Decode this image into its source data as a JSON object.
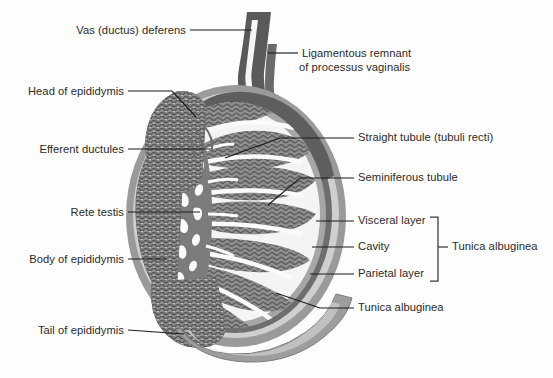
{
  "figure": {
    "background_color": "#fdfdfd",
    "width": 553,
    "height": 378
  },
  "palette": {
    "outer_parietal": "#9a9a9a",
    "cavity": "#cfcfcf",
    "visceral_layer": "#6e6e6e",
    "tunica_albuginea": "#a6a6a6",
    "interlobular_space": "#f4f4f4",
    "lobule_fill": "#8f8f8f",
    "tubule_stroke": "#5d5d5d",
    "mediastinum": "#7c7c7c",
    "rete_channel": "#fbfbfb",
    "epididymis": "#8a8a8a",
    "vas_deferens": "#5a5a5a",
    "label_text": "#2b2b2b",
    "leader_line": "#1d1d1d"
  },
  "labels": {
    "left": [
      {
        "id": "vas-deferens",
        "text": "Vas (ductus) deferens",
        "x": 186,
        "y": 34,
        "line": [
          [
            190,
            30
          ],
          [
            252,
            30
          ]
        ]
      },
      {
        "id": "head-of-epididymis",
        "text": "Head of epididymis",
        "x": 124,
        "y": 95,
        "line": [
          [
            128,
            91
          ],
          [
            172,
            91
          ],
          [
            196,
            117
          ]
        ]
      },
      {
        "id": "efferent-ductules",
        "text": "Efferent ductules",
        "x": 124,
        "y": 153,
        "line": [
          [
            128,
            149
          ],
          [
            211,
            149
          ]
        ]
      },
      {
        "id": "rete-testis",
        "text": "Rete testis",
        "x": 124,
        "y": 216,
        "line": [
          [
            128,
            212
          ],
          [
            200,
            212
          ]
        ]
      },
      {
        "id": "body-of-epididymis",
        "text": "Body of epididymis",
        "x": 124,
        "y": 263,
        "line": [
          [
            128,
            259
          ],
          [
            166,
            259
          ]
        ]
      },
      {
        "id": "tail-of-epididymis",
        "text": "Tail of epididymis",
        "x": 124,
        "y": 334,
        "line": [
          [
            128,
            330
          ],
          [
            184,
            334
          ]
        ]
      }
    ],
    "right": [
      {
        "id": "ligamentous-remnant",
        "text_line1": "Ligamentous remnant",
        "text_line2": "of processus vaginalis",
        "x": 302,
        "y": 57,
        "line": [
          [
            268,
            53
          ],
          [
            298,
            53
          ]
        ]
      },
      {
        "id": "straight-tubule",
        "text": "Straight tubule (tubuli recti)",
        "x": 358,
        "y": 141,
        "line": [
          [
            225,
            158
          ],
          [
            280,
            138
          ],
          [
            354,
            138
          ]
        ]
      },
      {
        "id": "seminiferous-tubule",
        "text": "Seminiferous tubule",
        "x": 358,
        "y": 181,
        "line": [
          [
            268,
            205
          ],
          [
            300,
            178
          ],
          [
            354,
            178
          ]
        ]
      },
      {
        "id": "visceral-layer",
        "text": "Visceral layer",
        "x": 358,
        "y": 224,
        "line": [
          [
            316,
            221
          ],
          [
            354,
            221
          ]
        ]
      },
      {
        "id": "cavity",
        "text": "Cavity",
        "x": 358,
        "y": 250,
        "line": [
          [
            312,
            247
          ],
          [
            354,
            247
          ]
        ]
      },
      {
        "id": "parietal-layer",
        "text": "Parietal layer",
        "x": 358,
        "y": 277,
        "line": [
          [
            310,
            274
          ],
          [
            354,
            274
          ]
        ]
      },
      {
        "id": "tunica-albuginea-pointer",
        "text": "Tunica albuginea",
        "x": 358,
        "y": 311,
        "line": [
          [
            276,
            293
          ],
          [
            320,
            308
          ],
          [
            354,
            308
          ]
        ]
      }
    ],
    "brace_group": {
      "id": "tunica-albuginea-brace",
      "text": "Tunica albuginea",
      "text_x": 452,
      "text_y": 250,
      "bracket": [
        [
          430,
          217
        ],
        [
          438,
          217
        ],
        [
          438,
          281
        ],
        [
          430,
          281
        ]
      ],
      "stem": [
        [
          438,
          247
        ],
        [
          448,
          247
        ]
      ]
    }
  },
  "anatomy": {
    "regions": [
      {
        "name": "tunica-vaginalis-parietal-layer",
        "note": "outermost mid-gray rim"
      },
      {
        "name": "tunica-vaginalis-cavity",
        "note": "light band between layers"
      },
      {
        "name": "tunica-vaginalis-visceral-layer",
        "note": "dark band on testis surface"
      },
      {
        "name": "tunica-albuginea",
        "note": "gray capsule inside visceral layer"
      },
      {
        "name": "seminiferous-lobules",
        "note": "wedge segments radiating from mediastinum"
      },
      {
        "name": "mediastinum-testis",
        "note": "central gray mass with rete channels"
      },
      {
        "name": "epididymis-head",
        "note": "convoluted mass upper-left"
      },
      {
        "name": "epididymis-body",
        "note": "convoluted band along left margin"
      },
      {
        "name": "epididymis-tail",
        "note": "convoluted mass lower-left"
      },
      {
        "name": "vas-deferens",
        "note": "tube ascending from top"
      },
      {
        "name": "ligamentous-remnant",
        "note": "thin strip right of vas deferens"
      }
    ]
  }
}
